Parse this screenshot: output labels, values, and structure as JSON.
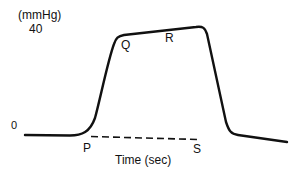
{
  "diagram": {
    "type": "pressure-time waveform",
    "y_axis": {
      "unit_label": "(mmHg)",
      "tick_top": "40",
      "tick_bottom": "0"
    },
    "x_axis": {
      "label": "Time (sec)"
    },
    "points": {
      "P": "P",
      "Q": "Q",
      "R": "R",
      "S": "S"
    },
    "colors": {
      "line": "#111111",
      "background": "#ffffff"
    }
  }
}
